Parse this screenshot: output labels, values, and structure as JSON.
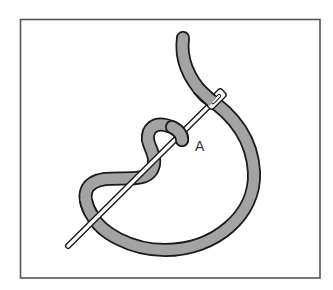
{
  "diagram": {
    "type": "embroidery-stitch-illustration",
    "elements": {
      "frame": {
        "shape": "rectangle",
        "color": "#555555"
      },
      "thread": {
        "fill": "#a3a3a3",
        "outline": "#1a1a1a"
      },
      "needle": {
        "fill": "#ffffff",
        "outline": "#1a1a1a"
      }
    },
    "labels": [
      {
        "id": "A",
        "text": "A"
      }
    ]
  }
}
